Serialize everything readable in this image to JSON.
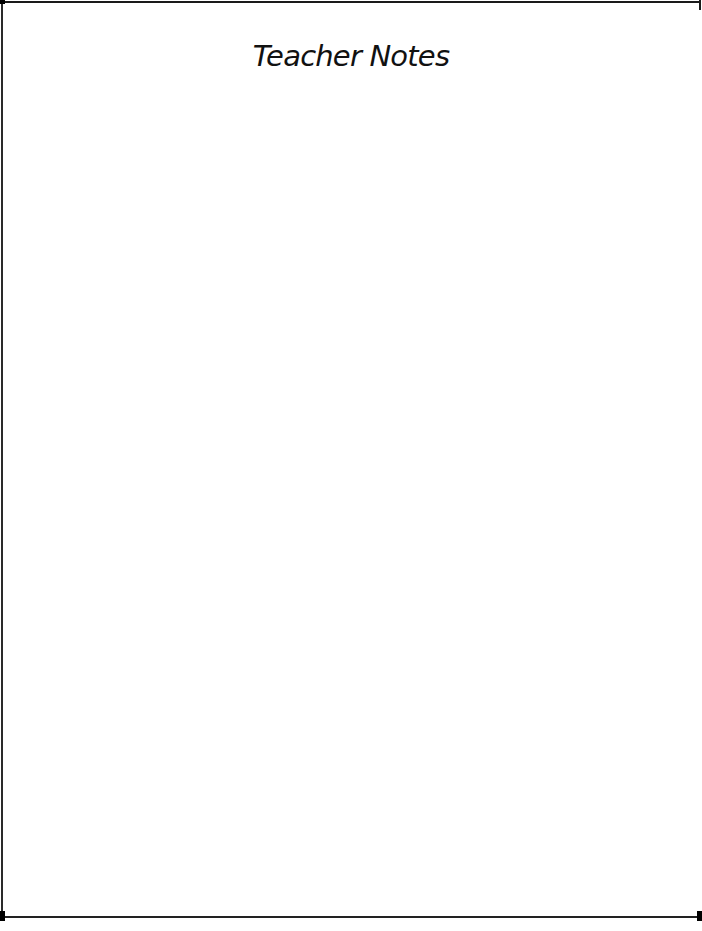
{
  "page": {
    "title": "Teacher Notes",
    "notes_body": ""
  },
  "frame": {
    "rule_color": "#1a1a1a",
    "corner_color": "#000000",
    "background": "#ffffff"
  }
}
